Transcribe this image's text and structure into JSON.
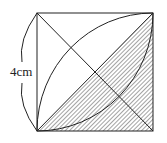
{
  "figure": {
    "side_label": "4cm",
    "line_color": "#222222"
  }
}
